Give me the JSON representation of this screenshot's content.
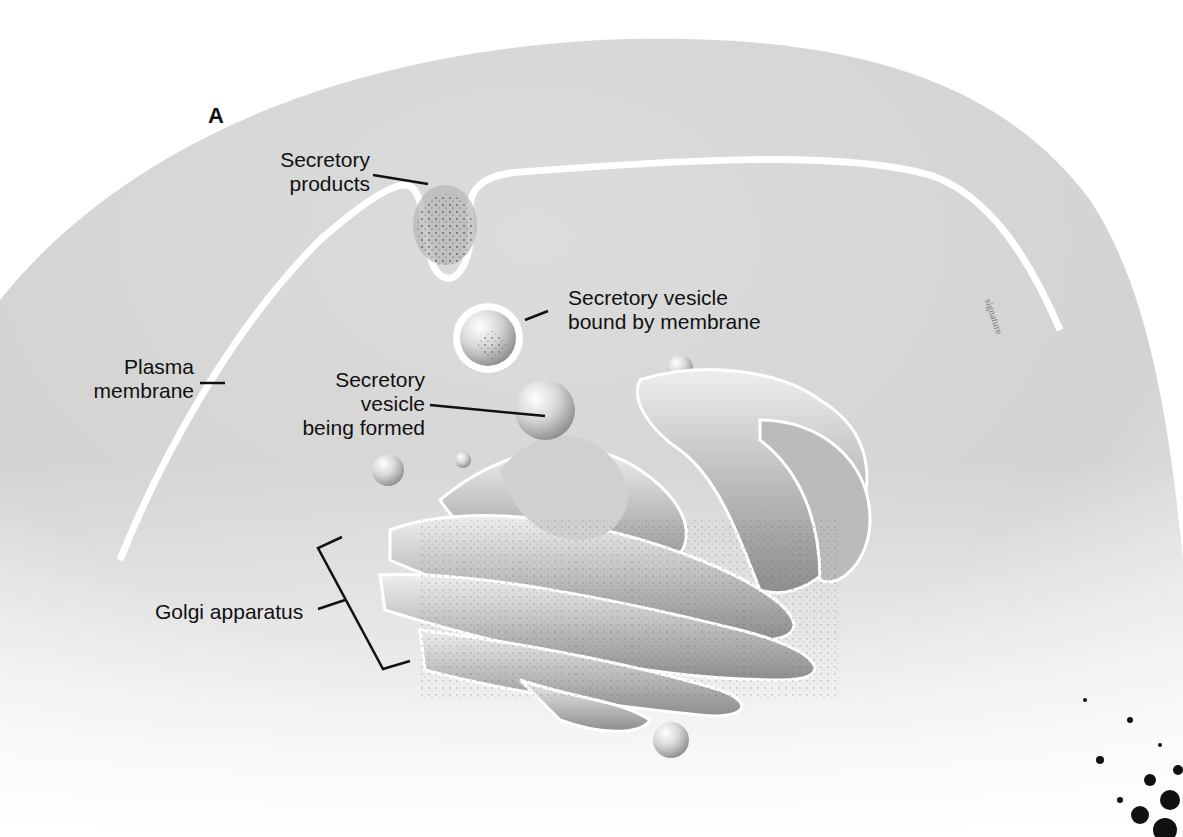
{
  "figure": {
    "panel_letter": "A",
    "labels": {
      "secretory_products": [
        "Secretory",
        "products"
      ],
      "secretory_vesicle_bound": [
        "Secretory vesicle",
        "bound by membrane"
      ],
      "plasma_membrane": [
        "Plasma",
        "membrane"
      ],
      "secretory_vesicle_forming": [
        "Secretory",
        "vesicle",
        "being formed"
      ],
      "golgi_apparatus": "Golgi apparatus"
    },
    "colors": {
      "background": "#ffffff",
      "cytoplasm": "#d9d9d9",
      "cytoplasm_light": "#ededed",
      "membrane": "#ffffff",
      "organelle": "#cfcfcf",
      "organelle_shadow": "#8a8a8a",
      "leader_line": "#111111"
    }
  }
}
